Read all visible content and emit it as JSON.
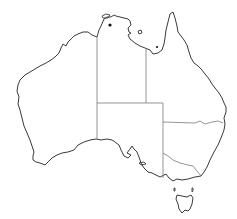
{
  "map": {
    "subject": "Australia outline map with state borders",
    "top_caption_fragment": "",
    "regions": [
      {
        "id": "western-australia"
      },
      {
        "id": "northern-territory"
      },
      {
        "id": "queensland"
      },
      {
        "id": "south-australia"
      },
      {
        "id": "new-south-wales"
      },
      {
        "id": "victoria"
      },
      {
        "id": "tasmania"
      }
    ],
    "markers": [
      {
        "id": "marker-1",
        "x": 110,
        "y": 25
      },
      {
        "id": "marker-2",
        "x": 157,
        "y": 47
      }
    ],
    "colors": {
      "coastline": "#3a3a3a",
      "state_border": "#7a7a7a",
      "background": "#ffffff"
    }
  }
}
